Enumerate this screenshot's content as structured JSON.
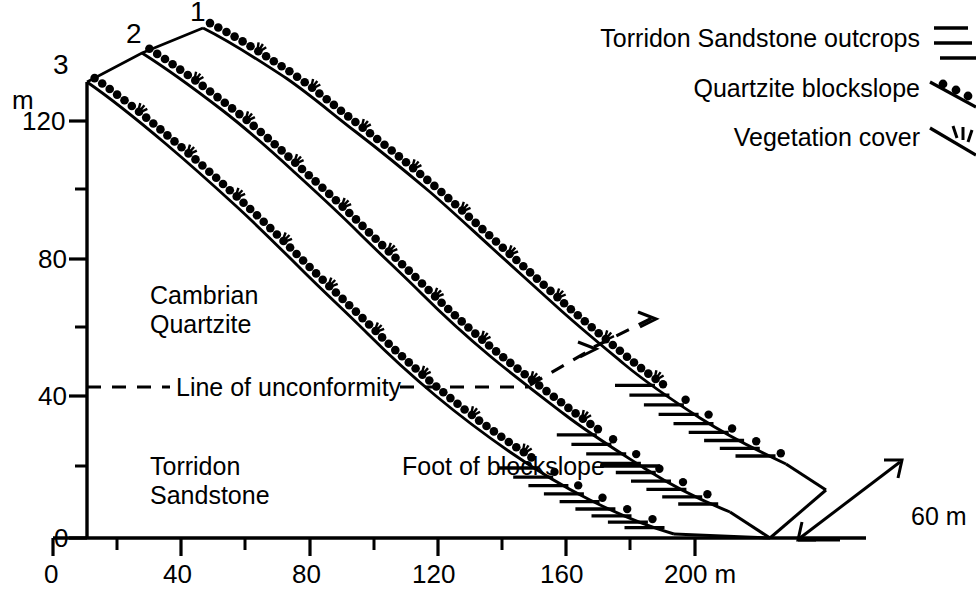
{
  "figure": {
    "type": "geomorphological-cross-section"
  },
  "axes": {
    "y_unit": "m",
    "y_ticks_major": [
      {
        "label": "120",
        "value": 120
      },
      {
        "label": "80",
        "value": 80
      },
      {
        "label": "40",
        "value": 40
      },
      {
        "label": "0",
        "value": 0
      }
    ],
    "y_minor_values": [
      100,
      60,
      20
    ],
    "y_range": [
      0,
      135
    ],
    "x_ticks_major": [
      {
        "label": "0",
        "value": 0
      },
      {
        "label": "40",
        "value": 40
      },
      {
        "label": "80",
        "value": 80
      },
      {
        "label": "120",
        "value": 120
      },
      {
        "label": "160",
        "value": 160
      },
      {
        "label": "200 m",
        "value": 200
      }
    ],
    "x_minor_values": [
      20,
      60,
      100,
      140,
      180
    ],
    "x_range": [
      0,
      215
    ],
    "x_unit": "m"
  },
  "profiles": [
    {
      "id": "1",
      "label": "1",
      "crest_x": 40,
      "crest_y": 132
    },
    {
      "id": "2",
      "label": "2",
      "crest_x": 22,
      "crest_y": 140
    },
    {
      "id": "3",
      "label": "3",
      "crest_x": 0,
      "crest_y": 133
    }
  ],
  "geology": {
    "upper_unit": "Cambrian\nQuartzite",
    "upper_unit_line1": "Cambrian",
    "upper_unit_line2": "Quartzite",
    "lower_unit_line1": "Torridon",
    "lower_unit_line2": "Sandstone",
    "unconformity_label": "Line of unconformity",
    "unconformity_elevation": 44
  },
  "annotations": {
    "foot_of_blockslope": "Foot of blockslope"
  },
  "legend": {
    "items": [
      {
        "label": "Torridon Sandstone outcrops",
        "symbol": "outcrop-hachure-icon"
      },
      {
        "label": "Quartzite blockslope",
        "symbol": "blockslope-dots-icon"
      },
      {
        "label": "Vegetation cover",
        "symbol": "vegetation-tuft-icon"
      }
    ]
  },
  "scale_bar": {
    "label": "60 m",
    "value": 60,
    "unit": "m"
  },
  "colors": {
    "ink": "#000000",
    "background": "#ffffff"
  },
  "chart_data": {
    "type": "line",
    "title": "",
    "xlabel": "200 m",
    "ylabel": "m",
    "xlim": [
      0,
      215
    ],
    "ylim": [
      0,
      135
    ],
    "grid": false,
    "legend_position": "top-right",
    "categories": [
      "1",
      "2",
      "3"
    ],
    "series": [
      {
        "name": "Profile 1",
        "x": [
          40,
          56,
          72,
          88,
          104,
          120,
          136,
          152,
          168,
          184,
          200,
          215
        ],
        "values": [
          132,
          120,
          108,
          97,
          86,
          75,
          64,
          54,
          44,
          35,
          27,
          20
        ]
      },
      {
        "name": "Profile 2",
        "x": [
          22,
          38,
          54,
          70,
          86,
          102,
          118,
          134,
          150,
          166,
          182,
          198,
          210
        ],
        "values": [
          140,
          127,
          115,
          103,
          92,
          81,
          70,
          60,
          50,
          40,
          31,
          23,
          18
        ]
      },
      {
        "name": "Profile 3",
        "x": [
          0,
          16,
          32,
          48,
          64,
          80,
          96,
          112,
          128,
          144,
          160,
          176,
          192,
          205
        ],
        "values": [
          133,
          121,
          110,
          99,
          88,
          77,
          67,
          57,
          47,
          38,
          29,
          20,
          12,
          5
        ]
      }
    ]
  }
}
